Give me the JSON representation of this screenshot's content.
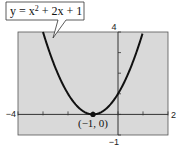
{
  "chart_data": {
    "type": "line",
    "title": "",
    "xlabel": "",
    "ylabel": "",
    "xlim": [
      -4,
      2
    ],
    "ylim": [
      -1,
      4
    ],
    "grid": false,
    "background_color": "#d9d9d9",
    "curve_color": "#111111",
    "series": [
      {
        "name": "y = x^2 + 2x + 1",
        "function": "x^2 + 2x + 1",
        "x": [
          -3,
          -2.5,
          -2,
          -1.5,
          -1,
          -0.5,
          0,
          0.5,
          1
        ],
        "y": [
          4,
          2.25,
          1,
          0.25,
          0,
          0.25,
          1,
          2.25,
          4
        ]
      }
    ],
    "x_ticks": [
      -4,
      -3,
      -2,
      -1,
      0,
      1,
      2
    ],
    "y_ticks": [
      -1,
      0,
      1,
      2,
      3,
      4
    ],
    "tick_labels": {
      "xmin": "−4",
      "xmax": "2",
      "ymax": "4",
      "ymin": "−1"
    },
    "equation_label": {
      "lhs": "y = x",
      "exp": "2",
      "rhs": " + 2x + 1"
    },
    "point": {
      "x": -1,
      "y": 0,
      "label": "(−1, 0)"
    }
  }
}
